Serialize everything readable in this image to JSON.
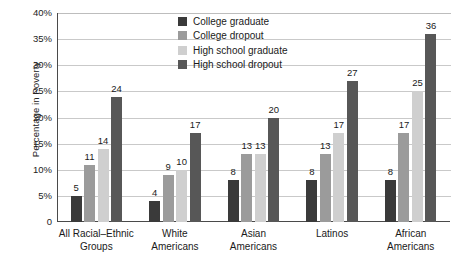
{
  "chart_data": {
    "type": "bar",
    "title": "",
    "xlabel": "",
    "ylabel": "Percentage in Poverty",
    "ylim": [
      0,
      40
    ],
    "ytick_labels": [
      "40%",
      "35%",
      "30%",
      "25%",
      "20%",
      "15%",
      "10%",
      "5%",
      "0"
    ],
    "ytick_values": [
      40,
      35,
      30,
      25,
      20,
      15,
      10,
      5,
      0
    ],
    "grid": true,
    "legend_position": "top-center",
    "categories": [
      "All Racial–Ethnic Groups",
      "White Americans",
      "Asian Americans",
      "Latinos",
      "African Americans"
    ],
    "category_lines": [
      [
        "All Racial–Ethnic",
        "Groups"
      ],
      [
        "White",
        "Americans"
      ],
      [
        "Asian",
        "Americans"
      ],
      [
        "Latinos",
        ""
      ],
      [
        "African",
        "Americans"
      ]
    ],
    "series": [
      {
        "name": "College graduate",
        "color": "#3a3a3a",
        "values": [
          5,
          4,
          8,
          8,
          8
        ]
      },
      {
        "name": "College dropout",
        "color": "#9b9b9b",
        "values": [
          11,
          9,
          13,
          13,
          17
        ]
      },
      {
        "name": "High school graduate",
        "color": "#cfcfcf",
        "values": [
          14,
          10,
          13,
          17,
          25
        ]
      },
      {
        "name": "High school dropout",
        "color": "#575757",
        "values": [
          24,
          17,
          20,
          27,
          36
        ]
      }
    ]
  },
  "colors": {
    "axis": "#4a4a4a",
    "grid": "#c9c9c9",
    "background": "#ffffff",
    "text": "#1a1a1a"
  }
}
